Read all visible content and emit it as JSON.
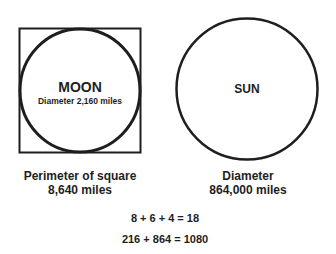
{
  "diagram": {
    "moon": {
      "title": "MOON",
      "subtitle": "Diameter 2,160 miles",
      "caption_line1": "Perimeter of square",
      "caption_line2": "8,640 miles"
    },
    "sun": {
      "title": "SUN",
      "caption_line1": "Diameter",
      "caption_line2": "864,000 miles"
    },
    "equations": [
      "8 + 6 + 4 = 18",
      "216 + 864 = 1080"
    ],
    "colors": {
      "stroke": "#1e1e1e",
      "background": "#ffffff"
    }
  }
}
